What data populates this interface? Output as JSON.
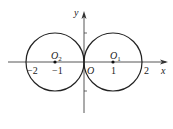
{
  "diagram": {
    "type": "coordinate-plane-circles",
    "axes": {
      "x_label": "x",
      "y_label": "y",
      "origin_label": "O"
    },
    "ticks": {
      "x": [
        {
          "value": -2,
          "label": "−2"
        },
        {
          "value": -1,
          "label": "−1"
        },
        {
          "value": 1,
          "label": "1"
        },
        {
          "value": 2,
          "label": "2"
        }
      ]
    },
    "circles": [
      {
        "name": "O1",
        "center_label": "O",
        "center_sub": "1",
        "center": [
          1,
          0
        ],
        "radius": 1
      },
      {
        "name": "O2",
        "center_label": "O",
        "center_sub": "2",
        "center": [
          -1,
          0
        ],
        "radius": 1
      }
    ],
    "colors": {
      "stroke": "#222222",
      "background": "#ffffff"
    }
  }
}
